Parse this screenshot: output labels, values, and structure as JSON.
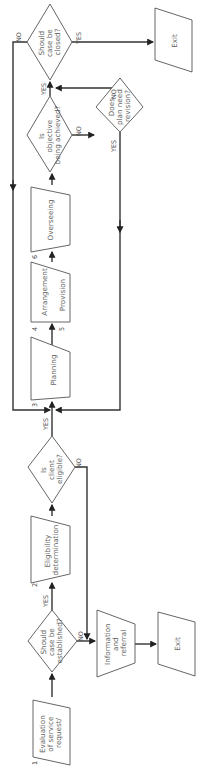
{
  "diagram": {
    "orientation": "rotated-90-ccw",
    "nodes": {
      "evaluation": {
        "number": "1",
        "lines": [
          "Evaluation",
          "of service",
          "request/"
        ]
      },
      "should_establish": {
        "lines": [
          "Should",
          "case be",
          "established?"
        ]
      },
      "eligibility": {
        "number": "2",
        "lines": [
          "Eligibility",
          "determination"
        ]
      },
      "client_eligible": {
        "lines": [
          "Is",
          "client",
          "eligible?"
        ]
      },
      "planning": {
        "number": "3",
        "lines": [
          "Planning"
        ]
      },
      "arrangement": {
        "number": "4",
        "lines": [
          "Arrangement"
        ]
      },
      "provision": {
        "number": "5",
        "lines": [
          "Provision"
        ]
      },
      "overseeing": {
        "number": "6",
        "lines": [
          "Overseeing"
        ]
      },
      "objective_achieved": {
        "lines": [
          "Is",
          "objective",
          "being achieved?"
        ]
      },
      "plan_revision": {
        "lines": [
          "Does",
          "plan need",
          "revision?"
        ]
      },
      "should_close": {
        "lines": [
          "Should",
          "case be",
          "closed?"
        ]
      },
      "exit_top": {
        "lines": [
          "Exit"
        ]
      },
      "info_referral": {
        "lines": [
          "Information",
          "and",
          "referral"
        ]
      },
      "exit_bottom": {
        "lines": [
          "Exit"
        ]
      }
    },
    "edge_labels": {
      "establish_yes": "YES",
      "establish_no": "NO",
      "eligible_yes": "YES",
      "eligible_no": "NO",
      "objective_yes": "YES",
      "objective_no": "NO",
      "revision_yes": "YES",
      "revision_no": "NO",
      "close_yes": "YES",
      "close_no": "NO"
    },
    "colors": {
      "stroke": "#555555",
      "line": "#333333",
      "text": "#666666",
      "background": "#ffffff"
    }
  }
}
